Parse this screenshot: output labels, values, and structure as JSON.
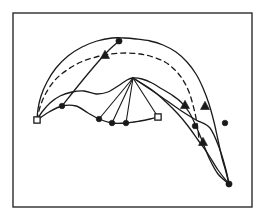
{
  "figure": {
    "title": "",
    "background_color": "#ffffff",
    "ink_color": "#1a1a1a",
    "frame": {
      "name": "figure-border",
      "x": 13,
      "y": 13,
      "width": 239,
      "height": 194,
      "stroke_color": "#2b2b2b",
      "stroke_width": 1.4
    }
  },
  "chart_data": {
    "type": "scatter",
    "title": "",
    "xlabel": "",
    "ylabel": "",
    "xlim": [
      13,
      252
    ],
    "ylim": [
      13,
      207
    ],
    "grid": false,
    "legend": "none",
    "coordinate_note": "Pixel coordinates in image space; y increases downward.",
    "series": [
      {
        "name": "outer-upper-solid-arc",
        "style": "solid",
        "stroke_width": 1.3,
        "marker": "none",
        "points": [
          [
            37,
            120
          ],
          [
            38,
            109
          ],
          [
            41,
            96
          ],
          [
            47,
            82
          ],
          [
            56,
            68
          ],
          [
            68,
            56
          ],
          [
            82,
            47
          ],
          [
            97,
            41
          ],
          [
            112,
            38
          ],
          [
            124,
            38
          ],
          [
            136,
            39
          ],
          [
            150,
            41
          ],
          [
            163,
            45
          ],
          [
            176,
            52
          ],
          [
            187,
            62
          ],
          [
            196,
            74
          ],
          [
            203,
            88
          ],
          [
            209,
            104
          ],
          [
            214,
            122
          ],
          [
            218,
            140
          ],
          [
            222,
            158
          ],
          [
            226,
            172
          ],
          [
            229,
            184
          ]
        ]
      },
      {
        "name": "inner-lower-solid-arc",
        "style": "solid",
        "stroke_width": 1.3,
        "marker": "none",
        "points": [
          [
            37,
            120
          ],
          [
            42,
            112
          ],
          [
            50,
            103
          ],
          [
            60,
            96
          ],
          [
            72,
            92
          ],
          [
            84,
            91
          ],
          [
            96,
            94
          ],
          [
            108,
            92
          ],
          [
            118,
            86
          ],
          [
            127,
            80
          ],
          [
            133,
            78
          ],
          [
            142,
            79
          ],
          [
            152,
            83
          ],
          [
            162,
            89
          ],
          [
            172,
            95
          ],
          [
            181,
            102
          ],
          [
            189,
            112
          ],
          [
            196,
            126
          ],
          [
            203,
            143
          ],
          [
            210,
            160
          ],
          [
            218,
            174
          ],
          [
            229,
            184
          ]
        ]
      },
      {
        "name": "dashed-median-arc",
        "style": "dashed",
        "stroke_width": 1.3,
        "dash_pattern": "5,4",
        "marker": "none",
        "points": [
          [
            37,
            120
          ],
          [
            40,
            107
          ],
          [
            46,
            93
          ],
          [
            55,
            80
          ],
          [
            67,
            70
          ],
          [
            81,
            62
          ],
          [
            96,
            57
          ],
          [
            111,
            54
          ],
          [
            126,
            53
          ],
          [
            140,
            54
          ],
          [
            153,
            57
          ],
          [
            165,
            62
          ],
          [
            175,
            70
          ],
          [
            183,
            80
          ],
          [
            189,
            92
          ],
          [
            193,
            105
          ],
          [
            196,
            118
          ],
          [
            198,
            130
          ],
          [
            199,
            140
          ]
        ]
      },
      {
        "name": "lower-chain-solid",
        "style": "solid",
        "stroke_width": 1.3,
        "marker": "filled-circle",
        "points": [
          [
            37,
            120
          ],
          [
            49,
            112
          ],
          [
            62,
            106
          ],
          [
            76,
            106
          ],
          [
            88,
            113
          ],
          [
            99,
            119
          ],
          [
            112,
            123
          ],
          [
            126,
            123
          ],
          [
            140,
            121
          ],
          [
            150,
            119
          ],
          [
            158,
            117
          ]
        ]
      },
      {
        "name": "upper-chord-solid",
        "style": "solid",
        "stroke_width": 1.3,
        "marker": "none",
        "points": [
          [
            62,
            106
          ],
          [
            82,
            81
          ],
          [
            98,
            62
          ],
          [
            110,
            49
          ],
          [
            119,
            41
          ]
        ]
      },
      {
        "name": "right-descending-chain",
        "style": "solid",
        "stroke_width": 1.3,
        "marker": "filled-triangle",
        "points": [
          [
            133,
            78
          ],
          [
            152,
            90
          ],
          [
            166,
            102
          ],
          [
            178,
            114
          ],
          [
            188,
            126
          ],
          [
            198,
            140
          ],
          [
            208,
            154
          ],
          [
            218,
            170
          ],
          [
            229,
            184
          ]
        ]
      },
      {
        "name": "right-outer-chain",
        "style": "solid",
        "stroke_width": 1.3,
        "marker": "filled-circle",
        "points": [
          [
            133,
            78
          ],
          [
            160,
            96
          ],
          [
            180,
            110
          ],
          [
            196,
            120
          ],
          [
            210,
            128
          ],
          [
            220,
            150
          ],
          [
            226,
            170
          ],
          [
            229,
            184
          ]
        ]
      },
      {
        "name": "fan-spoke-1",
        "style": "solid",
        "stroke_width": 1.1,
        "marker": "none",
        "points": [
          [
            133,
            78
          ],
          [
            99,
            119
          ]
        ]
      },
      {
        "name": "fan-spoke-2",
        "style": "solid",
        "stroke_width": 1.1,
        "marker": "none",
        "points": [
          [
            133,
            78
          ],
          [
            112,
            123
          ]
        ]
      },
      {
        "name": "fan-spoke-3",
        "style": "solid",
        "stroke_width": 1.1,
        "marker": "none",
        "points": [
          [
            133,
            78
          ],
          [
            126,
            123
          ]
        ]
      },
      {
        "name": "fan-spoke-4",
        "style": "solid",
        "stroke_width": 1.1,
        "marker": "none",
        "points": [
          [
            133,
            78
          ],
          [
            158,
            117
          ]
        ]
      }
    ],
    "markers": [
      {
        "name": "endpoint-left-open",
        "shape": "open-square",
        "x": 37,
        "y": 120,
        "size": 5
      },
      {
        "name": "node-open-right",
        "shape": "open-square",
        "x": 158,
        "y": 117,
        "size": 5
      },
      {
        "name": "node-apex-top",
        "shape": "filled-circle",
        "x": 119,
        "y": 41,
        "size": 4.2
      },
      {
        "name": "node-triangle-upper",
        "shape": "filled-triangle",
        "x": 105,
        "y": 55,
        "size": 5
      },
      {
        "name": "node-lower-chain-1",
        "shape": "filled-circle",
        "x": 62,
        "y": 106,
        "size": 3.8
      },
      {
        "name": "node-lower-chain-2",
        "shape": "filled-circle",
        "x": 99,
        "y": 119,
        "size": 3.8
      },
      {
        "name": "node-lower-chain-3",
        "shape": "filled-circle",
        "x": 112,
        "y": 123,
        "size": 3.8
      },
      {
        "name": "node-lower-chain-4",
        "shape": "filled-circle",
        "x": 126,
        "y": 123,
        "size": 3.8
      },
      {
        "name": "node-right-triangle-1",
        "shape": "filled-triangle",
        "x": 185,
        "y": 105,
        "size": 5
      },
      {
        "name": "node-right-triangle-2",
        "shape": "filled-triangle",
        "x": 205,
        "y": 106,
        "size": 5
      },
      {
        "name": "node-right-triangle-3",
        "shape": "filled-triangle",
        "x": 203,
        "y": 142,
        "size": 5
      },
      {
        "name": "node-right-circle-1",
        "shape": "filled-circle",
        "x": 195,
        "y": 126,
        "size": 3.8
      },
      {
        "name": "node-right-circle-2",
        "shape": "filled-circle",
        "x": 225,
        "y": 123,
        "size": 3.8
      },
      {
        "name": "node-tail-tip",
        "shape": "filled-circle",
        "x": 229,
        "y": 184,
        "size": 4.2
      }
    ]
  }
}
